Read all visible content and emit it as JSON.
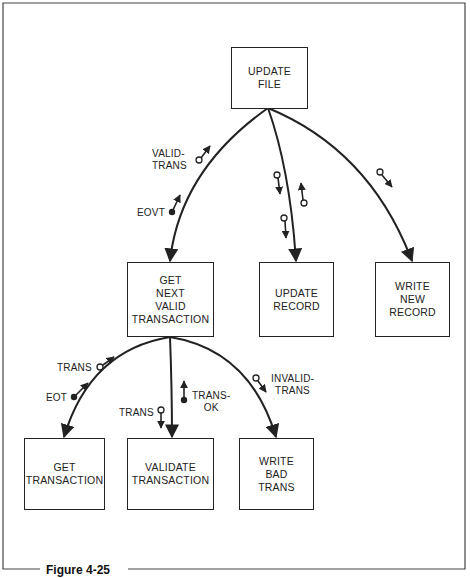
{
  "figure": {
    "caption": "Figure 4-25"
  },
  "modules": {
    "update_file": {
      "label": "UPDATE\nFILE"
    },
    "get_next_valid_transaction": {
      "label": "GET\nNEXT\nVALID\nTRANSACTION"
    },
    "update_record": {
      "label": "UPDATE\nRECORD"
    },
    "write_new_record": {
      "label": "WRITE\nNEW\nRECORD"
    },
    "get_transaction": {
      "label": "GET\nTRANSACTION"
    },
    "validate_transaction": {
      "label": "VALIDATE\nTRANSACTION"
    },
    "write_bad_trans": {
      "label": "WRITE\nBAD\nTRANS"
    }
  },
  "flows": {
    "valid_trans": {
      "label": "VALID-\nTRANS",
      "type": "data",
      "direction": "up"
    },
    "eovt": {
      "label": "EOVT",
      "type": "control",
      "direction": "up"
    },
    "trans_up": {
      "label": "TRANS",
      "type": "data",
      "direction": "up"
    },
    "eot": {
      "label": "EOT",
      "type": "control",
      "direction": "up"
    },
    "trans_down": {
      "label": "TRANS",
      "type": "data",
      "direction": "down"
    },
    "trans_ok": {
      "label": "TRANS-\nOK",
      "type": "control",
      "direction": "up"
    },
    "invalid_trans": {
      "label": "INVALID-\nTRANS",
      "type": "data",
      "direction": "down"
    }
  },
  "colors": {
    "ink": "#222222",
    "background": "#ffffff"
  }
}
